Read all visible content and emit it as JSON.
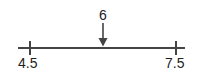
{
  "diagram": {
    "type": "number-line",
    "line_color": "#444444",
    "ticks": [
      {
        "value": 4.5,
        "label": "4.5"
      },
      {
        "value": 7.5,
        "label": "7.5"
      }
    ],
    "marker": {
      "value": 6,
      "label": "6",
      "style": "down-arrow"
    }
  }
}
